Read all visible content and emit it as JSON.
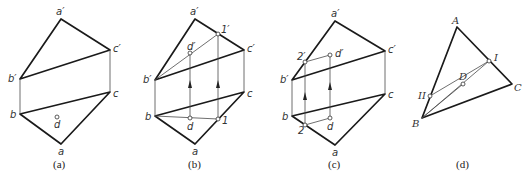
{
  "figure": {
    "panels": [
      {
        "id": "a",
        "caption": "(a)",
        "labels": {
          "a_prime": "a′",
          "b_prime": "b′",
          "c_prime": "c′",
          "a": "a",
          "b": "b",
          "c": "c",
          "d": "d"
        }
      },
      {
        "id": "b",
        "caption": "(b)",
        "labels": {
          "a_prime": "a′",
          "b_prime": "b′",
          "c_prime": "c′",
          "d_prime": "d′",
          "one_prime": "1′",
          "a": "a",
          "b": "b",
          "c": "c",
          "d": "d",
          "one": "1"
        }
      },
      {
        "id": "c",
        "caption": "(c)",
        "labels": {
          "a_prime": "a′",
          "b_prime": "b′",
          "c_prime": "c′",
          "d_prime": "d′",
          "two_prime": "2′",
          "a": "a",
          "b": "b",
          "c": "c",
          "d": "d",
          "two": "2"
        }
      },
      {
        "id": "d",
        "caption": "(d)",
        "labels": {
          "A": "A",
          "B": "B",
          "C": "C",
          "D": "D",
          "I": "I",
          "II": "II"
        }
      }
    ]
  }
}
